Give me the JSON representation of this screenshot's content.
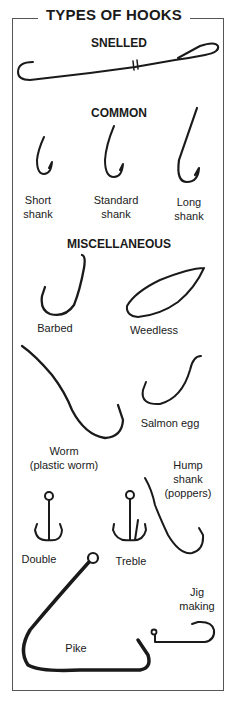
{
  "title": "TYPES OF HOOKS",
  "sections": {
    "snelled": "SNELLED",
    "common": "COMMON",
    "miscellaneous": "MISCELLANEOUS"
  },
  "common_labels": {
    "short": "Short\nshank",
    "standard": "Standard\nshank",
    "long": "Long\nshank"
  },
  "misc_labels": {
    "barbed": "Barbed",
    "weedless": "Weedless",
    "salmon_egg": "Salmon egg",
    "worm": "Worm\n(plastic worm)",
    "hump_shank": "Hump\nshank\n(poppers)",
    "double": "Double",
    "treble": "Treble",
    "pike": "Pike",
    "jig": "Jig\nmaking"
  }
}
